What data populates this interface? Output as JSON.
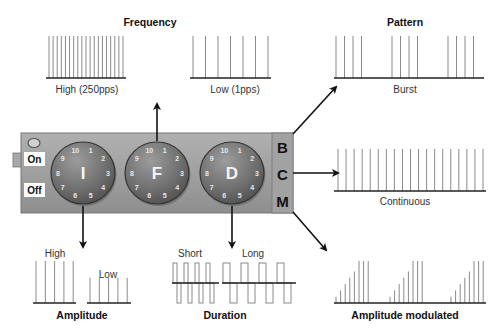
{
  "colors": {
    "panel": "#9c9c9c",
    "panel_edge": "#6e6e6e",
    "knob_dark": "#5a5a5a",
    "knob_light": "#9a9a9a",
    "pulse_line": "#8a8a8a",
    "baseline": "#222222",
    "arrow": "#111111"
  },
  "device": {
    "switch": {
      "on_label": "On",
      "off_label": "Off"
    },
    "knobs": [
      {
        "letter": "I",
        "meaning": "intensity",
        "dial": [
          "10",
          "1",
          "2",
          "3",
          "4",
          "5",
          "6",
          "7",
          "8",
          "9"
        ]
      },
      {
        "letter": "F",
        "meaning": "frequency",
        "dial": [
          "10",
          "1",
          "2",
          "3",
          "4",
          "5",
          "6",
          "7",
          "8",
          "9"
        ]
      },
      {
        "letter": "D",
        "meaning": "duration",
        "dial": [
          "10",
          "1",
          "2",
          "3",
          "4",
          "5",
          "6",
          "7",
          "8",
          "9"
        ]
      }
    ],
    "mode_buttons": [
      "B",
      "C",
      "M"
    ]
  },
  "panels": {
    "frequency": {
      "title": "Frequency",
      "high": {
        "label": "High (250pps)",
        "pulse_count": 19
      },
      "low": {
        "label": "Low (1pps)",
        "pulse_count": 7
      }
    },
    "pattern": {
      "title": "Pattern",
      "burst": {
        "label": "Burst",
        "bursts": 3,
        "pulses_per_burst": 4
      },
      "continuous": {
        "label": "Continuous",
        "pulse_count": 19
      },
      "amplitude_modulated": {
        "label": "Amplitude modulated",
        "cycles": 3,
        "ramp_levels": [
          0.15,
          0.3,
          0.45,
          0.6,
          0.75,
          1.0,
          1.0,
          1.0
        ]
      }
    },
    "amplitude": {
      "title": "Amplitude",
      "high": {
        "label": "High",
        "pulse_count": 5,
        "level": 1.0
      },
      "low": {
        "label": "Low",
        "pulse_count": 5,
        "level": 0.6
      }
    },
    "duration": {
      "title": "Duration",
      "short": {
        "label": "Short",
        "pulse_count": 4
      },
      "long": {
        "label": "Long",
        "pulse_count": 4
      }
    }
  }
}
